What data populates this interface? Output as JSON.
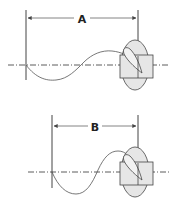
{
  "diagrams": [
    {
      "id": "top",
      "dimension_label": "A",
      "description": "Propeller pitch travel distance A"
    },
    {
      "id": "bottom",
      "dimension_label": "B",
      "description": "Propeller pitch travel distance B"
    }
  ],
  "colors": {
    "line": "#444444",
    "fill": "#e6e6e6",
    "background": "#ffffff"
  }
}
